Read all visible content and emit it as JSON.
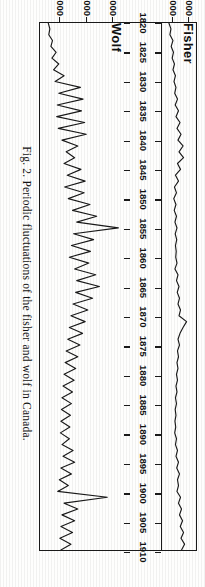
{
  "figure": {
    "caption": "Fig. 2.  Periodic fluctuations of the fisher and wolf in Canada.",
    "caption_number": "Fig. 2.",
    "rotation_degrees": 90,
    "ink_color": "#1a1a1a",
    "paper_color": "#fefefd"
  },
  "chart_data": {
    "type": "line",
    "title": "Periodic fluctuations of the fisher and wolf in Canada",
    "xlabel": "",
    "ylabel": "",
    "xlim": [
      1820,
      1910
    ],
    "grid": false,
    "legend": "inline-panel-labels",
    "xticks": [
      1820,
      1825,
      1830,
      1835,
      1840,
      1845,
      1850,
      1855,
      1860,
      1865,
      1870,
      1875,
      1880,
      1885,
      1890,
      1895,
      1900,
      1905,
      1910
    ],
    "xticklabels": [
      "1820",
      "1825",
      "1830",
      "1835",
      "1840",
      "1845",
      "1850",
      "1855",
      "1860",
      "1865",
      "1870",
      "1875",
      "1880",
      "1885",
      "1890",
      "1895",
      "1900",
      "1905",
      "1910"
    ],
    "panels": [
      {
        "name": "Fisher",
        "ylabel": "",
        "ylim": [
          3200,
          9000
        ],
        "yticks": [
          5000,
          8000
        ],
        "yticklabels": [
          "5,000",
          "8,000"
        ],
        "x": [
          1820,
          1821,
          1822,
          1823,
          1824,
          1825,
          1826,
          1827,
          1828,
          1829,
          1830,
          1831,
          1832,
          1833,
          1834,
          1835,
          1836,
          1837,
          1838,
          1839,
          1840,
          1841,
          1842,
          1843,
          1844,
          1845,
          1846,
          1847,
          1848,
          1849,
          1850,
          1851,
          1852,
          1853,
          1854,
          1855,
          1856,
          1857,
          1858,
          1859,
          1860,
          1861,
          1862,
          1863,
          1864,
          1865,
          1866,
          1867,
          1868,
          1869,
          1870,
          1871,
          1872,
          1873,
          1874,
          1875,
          1876,
          1877,
          1878,
          1879,
          1880,
          1881,
          1882,
          1883,
          1884,
          1885,
          1886,
          1887,
          1888,
          1889,
          1890,
          1891,
          1892,
          1893,
          1894,
          1895,
          1896,
          1897,
          1898,
          1899,
          1900,
          1901,
          1902,
          1903,
          1904,
          1905,
          1906,
          1907,
          1908,
          1909,
          1910
        ],
        "values": [
          4100,
          4500,
          4300,
          4900,
          4550,
          5000,
          4750,
          5200,
          4900,
          5400,
          5100,
          5500,
          5250,
          5800,
          5350,
          6000,
          5500,
          6300,
          5700,
          6500,
          5900,
          6900,
          6100,
          7000,
          5800,
          6400,
          5400,
          6000,
          5200,
          5600,
          5050,
          5500,
          5150,
          5600,
          5300,
          5700,
          5350,
          5650,
          5400,
          5550,
          5450,
          5700,
          5300,
          5900,
          5600,
          6100,
          5750,
          6200,
          5900,
          6400,
          6100,
          7600,
          6900,
          6300,
          5900,
          6200,
          5800,
          6000,
          5700,
          5900,
          5600,
          5800,
          5500,
          5700,
          5400,
          5600,
          5350,
          5500,
          5300,
          5450,
          5250,
          5600,
          5400,
          5800,
          5500,
          6000,
          5650,
          6200,
          5800,
          6000,
          5700,
          6400,
          6000,
          6600,
          6200,
          6800,
          6350,
          7000,
          6500,
          7200,
          6600
        ]
      },
      {
        "name": "Wolf",
        "ylabel": "",
        "ylim": [
          1500,
          16500
        ],
        "yticks": [
          5000,
          10000,
          15000
        ],
        "yticklabels": [
          "5,000",
          "10,000",
          "15,000"
        ],
        "x": [
          1820,
          1821,
          1822,
          1823,
          1824,
          1825,
          1826,
          1827,
          1828,
          1829,
          1830,
          1831,
          1832,
          1833,
          1834,
          1835,
          1836,
          1837,
          1838,
          1839,
          1840,
          1841,
          1842,
          1843,
          1844,
          1845,
          1846,
          1847,
          1848,
          1849,
          1850,
          1851,
          1852,
          1853,
          1854,
          1855,
          1856,
          1857,
          1858,
          1859,
          1860,
          1861,
          1862,
          1863,
          1864,
          1865,
          1866,
          1867,
          1868,
          1869,
          1870,
          1871,
          1872,
          1873,
          1874,
          1875,
          1876,
          1877,
          1878,
          1879,
          1880,
          1881,
          1882,
          1883,
          1884,
          1885,
          1886,
          1887,
          1888,
          1889,
          1890,
          1891,
          1892,
          1893,
          1894,
          1895,
          1896,
          1897,
          1898,
          1899,
          1900,
          1901,
          1902,
          1903,
          1904,
          1905,
          1906,
          1907,
          1908,
          1909,
          1910
        ],
        "values": [
          2600,
          2900,
          2700,
          3400,
          3100,
          4100,
          3300,
          4600,
          3600,
          5600,
          3900,
          8700,
          4600,
          9200,
          4300,
          8900,
          4200,
          9500,
          4500,
          9800,
          5200,
          8200,
          6000,
          7600,
          5600,
          8800,
          6200,
          9600,
          5700,
          9400,
          6400,
          10500,
          7200,
          11800,
          8000,
          15900,
          7400,
          11200,
          7000,
          10600,
          6600,
          10300,
          7600,
          11600,
          8000,
          12300,
          7800,
          11000,
          7300,
          10100,
          6900,
          9600,
          6600,
          9100,
          6300,
          8600,
          6000,
          8200,
          5800,
          7800,
          5600,
          7500,
          5400,
          7200,
          5200,
          7000,
          5100,
          6800,
          5000,
          6700,
          4900,
          6600,
          5200,
          7300,
          5400,
          7600,
          5000,
          7000,
          4700,
          6400,
          4400,
          13800,
          5600,
          8200,
          5200,
          7600,
          5000,
          7200,
          4800,
          6900,
          5000
        ]
      }
    ]
  },
  "axis_strip": {
    "name": "year-axis",
    "ticks": [
      "1820",
      "1825",
      "1830",
      "1835",
      "1840",
      "1845",
      "1850",
      "1855",
      "1860",
      "1865",
      "1870",
      "1875",
      "1880",
      "1885",
      "1890",
      "1895",
      "1900",
      "1905",
      "1910"
    ]
  }
}
